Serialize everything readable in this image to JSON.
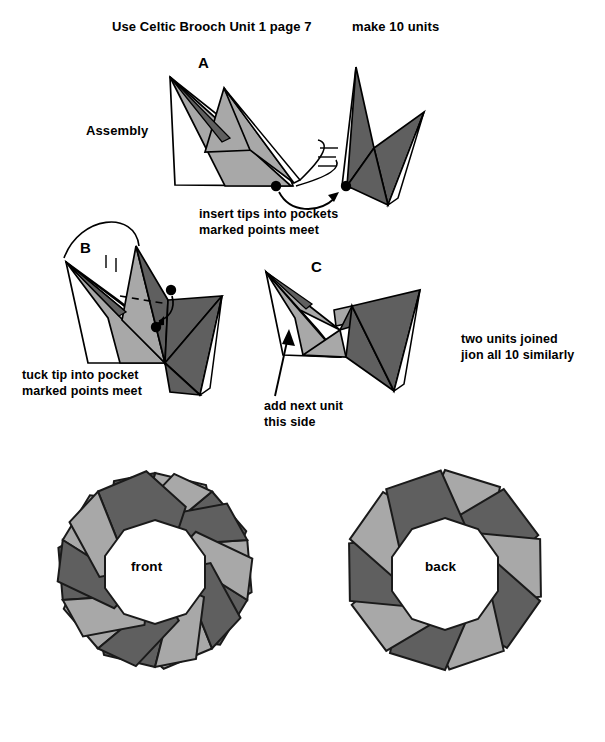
{
  "document": {
    "header_left": "Use Celtic Brooch Unit 1 page 7",
    "header_right": "make 10 units",
    "section_label": "Assembly"
  },
  "steps": [
    {
      "letter": "A",
      "annotation_line1": "insert tips into pockets",
      "annotation_line2": "marked points meet"
    },
    {
      "letter": "B",
      "annotation_line1": "tuck tip into pocket",
      "annotation_line2": "marked points meet"
    },
    {
      "letter": "C",
      "annotation_line1": "add next unit",
      "annotation_line2": "this side",
      "side_note_line1": "two units joined",
      "side_note_line2": "jion all 10 similarly"
    }
  ],
  "rings": [
    {
      "label": "front",
      "unit_count": 10
    },
    {
      "label": "back",
      "unit_count": 10
    }
  ],
  "colors": {
    "paper_light": "#a8a8a8",
    "paper_dark": "#5f5f5f",
    "paper_white": "#ffffff",
    "outline": "#000000",
    "background": "#ffffff"
  }
}
